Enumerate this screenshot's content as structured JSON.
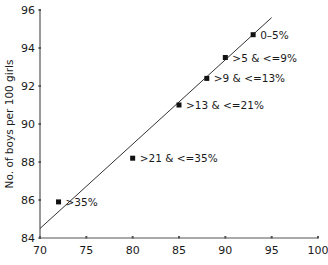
{
  "chart_data": {
    "type": "scatter",
    "title": "",
    "xlabel": "",
    "ylabel": "No. of boys per 100 girls",
    "xlim": [
      70,
      100
    ],
    "ylim": [
      84,
      96
    ],
    "x_ticks": [
      70,
      75,
      80,
      85,
      90,
      95,
      100
    ],
    "y_ticks": [
      84,
      86,
      88,
      90,
      92,
      94,
      96
    ],
    "grid": false,
    "legend": null,
    "series": [
      {
        "name": "groups",
        "points": [
          {
            "label": "0–5%",
            "x": 93,
            "y": 94.7
          },
          {
            "label": ">5 & <=9%",
            "x": 90,
            "y": 93.5
          },
          {
            "label": ">9 & <=13%",
            "x": 88,
            "y": 92.4
          },
          {
            "label": ">13 & <=21%",
            "x": 85,
            "y": 91.0
          },
          {
            "label": ">21 & <=35%",
            "x": 80,
            "y": 88.2
          },
          {
            "label": ">35%",
            "x": 72,
            "y": 85.9
          }
        ]
      }
    ],
    "trend_line": {
      "x1": 70,
      "y1": 84.5,
      "x2": 95,
      "y2": 95.6
    }
  },
  "colors": {
    "axis": "#555555",
    "point": "#111111",
    "line": "#333333",
    "text": "#1a1a1a"
  }
}
